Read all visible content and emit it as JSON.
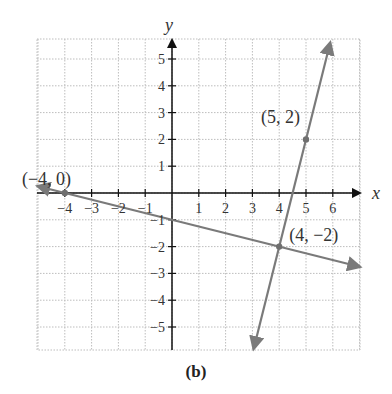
{
  "figure": {
    "caption": "(b)",
    "axes": {
      "x_label": "x",
      "y_label": "y",
      "x_ticks": [
        -4,
        -3,
        -2,
        -1,
        1,
        2,
        3,
        4,
        5,
        6
      ],
      "x_tick_labels": [
        "−4",
        "−3",
        "−2",
        "−1",
        "1",
        "2",
        "3",
        "4",
        "5",
        "6"
      ],
      "y_ticks": [
        5,
        4,
        3,
        2,
        1,
        -1,
        -2,
        -3,
        -4,
        -5
      ],
      "y_tick_labels": [
        "5",
        "4",
        "3",
        "2",
        "1",
        "−1",
        "−2",
        "−3",
        "−4",
        "−5"
      ]
    },
    "points": [
      {
        "label": "(−4, 0)",
        "x": -4,
        "y": 0
      },
      {
        "label": "(5, 2)",
        "x": 5,
        "y": 2
      },
      {
        "label": "(4, −2)",
        "x": 4,
        "y": -2
      }
    ],
    "colors": {
      "line": "#7a7a7a",
      "axis": "#111111",
      "grid": "#bdbdbd",
      "text": "#333333"
    }
  },
  "chart_data": {
    "type": "line",
    "title": "",
    "caption": "(b)",
    "xlabel": "x",
    "ylabel": "y",
    "xlim": [
      -5,
      7
    ],
    "ylim": [
      -5.8,
      5.8
    ],
    "grid": true,
    "series": [
      {
        "name": "line through (-4,0) and (4,-2)",
        "equation": "y = -x/4 - 1",
        "x": [
          -5,
          -4,
          0,
          4,
          7
        ],
        "y": [
          0.25,
          0,
          -1,
          -2,
          -2.75
        ]
      },
      {
        "name": "line through (4,-2) and (5,2)",
        "equation": "y = 4x - 18",
        "x": [
          3.05,
          4,
          4.5,
          5,
          5.9
        ],
        "y": [
          -5.8,
          -2,
          0,
          2,
          5.6
        ]
      }
    ],
    "annotations": [
      "(−4, 0)",
      "(5, 2)",
      "(4, −2)"
    ]
  }
}
